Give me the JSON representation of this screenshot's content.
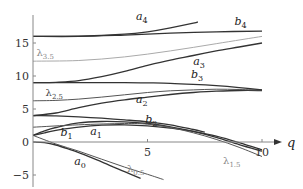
{
  "chart_data": {
    "type": "line",
    "title": "",
    "xlabel": "q",
    "ylabel": "",
    "xlim": [
      0,
      10.8
    ],
    "ylim": [
      -5.5,
      19
    ],
    "x_ticks": [
      5,
      10
    ],
    "x_tick_labels": [
      "5",
      "10"
    ],
    "y_ticks": [
      -5,
      0,
      5,
      10,
      15
    ],
    "y_tick_labels": [
      "−5",
      "0",
      "5",
      "10",
      "15"
    ],
    "grid": false,
    "legend": "none (inline curve labels)",
    "series": [
      {
        "name": "a0",
        "label": "a",
        "sub": "0",
        "color": "#333333",
        "points": [
          [
            0,
            0
          ],
          [
            0.5,
            -0.1
          ],
          [
            1,
            -0.45
          ],
          [
            1.5,
            -1.0
          ],
          [
            2,
            -1.6
          ],
          [
            2.5,
            -2.3
          ],
          [
            3,
            -3.0
          ],
          [
            3.5,
            -3.75
          ],
          [
            4,
            -4.5
          ],
          [
            4.7,
            -5.5
          ]
        ]
      },
      {
        "name": "λ0.5",
        "label": "λ",
        "sub": "0.5",
        "color": "#555555",
        "points": [
          [
            0,
            1
          ],
          [
            1,
            -0.3
          ],
          [
            2,
            -1.4
          ],
          [
            3,
            -2.6
          ],
          [
            4,
            -3.8
          ],
          [
            5,
            -4.9
          ],
          [
            5.7,
            -5.7
          ]
        ]
      },
      {
        "name": "b1",
        "label": "b",
        "sub": "1",
        "color": "#333333",
        "points": [
          [
            0,
            1
          ],
          [
            0.5,
            1.4
          ],
          [
            1,
            1.75
          ],
          [
            2,
            2.25
          ],
          [
            3,
            2.55
          ],
          [
            4,
            2.6
          ],
          [
            5,
            2.45
          ],
          [
            6,
            2.1
          ],
          [
            7,
            1.6
          ],
          [
            8,
            0.9
          ],
          [
            9,
            -0.1
          ],
          [
            10,
            -1.2
          ]
        ]
      },
      {
        "name": "a1",
        "label": "a",
        "sub": "1",
        "color": "#333333",
        "points": [
          [
            0,
            1
          ],
          [
            0.5,
            1.7
          ],
          [
            1,
            2.2
          ],
          [
            2,
            2.9
          ],
          [
            3,
            3.1
          ],
          [
            4,
            3.05
          ],
          [
            5,
            2.8
          ],
          [
            6,
            2.3
          ],
          [
            7,
            1.6
          ],
          [
            8,
            0.7
          ],
          [
            9,
            -0.4
          ],
          [
            10,
            -1.4
          ]
        ]
      },
      {
        "name": "λ1.5",
        "label": "λ",
        "sub": "1.5",
        "color": "#555555",
        "points": [
          [
            0,
            2.25
          ],
          [
            2,
            2.6
          ],
          [
            4,
            2.8
          ],
          [
            5,
            2.7
          ],
          [
            6,
            2.2
          ],
          [
            7,
            1.4
          ],
          [
            8,
            0.4
          ],
          [
            9,
            -0.8
          ],
          [
            10,
            -2.2
          ]
        ]
      },
      {
        "name": "b2",
        "label": "b",
        "sub": "2",
        "color": "#333333",
        "points": [
          [
            0,
            4
          ],
          [
            1,
            3.95
          ],
          [
            2,
            3.8
          ],
          [
            3,
            3.6
          ],
          [
            4,
            3.35
          ],
          [
            5,
            3.05
          ],
          [
            6,
            2.6
          ],
          [
            7,
            1.9
          ],
          [
            7.5,
            1.5
          ]
        ]
      },
      {
        "name": "a2",
        "label": "a",
        "sub": "2",
        "color": "#333333",
        "points": [
          [
            0,
            4
          ],
          [
            1,
            4.4
          ],
          [
            2,
            5.2
          ],
          [
            3,
            5.9
          ],
          [
            4,
            6.4
          ],
          [
            5,
            6.8
          ],
          [
            6,
            7.2
          ],
          [
            7,
            7.5
          ],
          [
            8,
            7.7
          ],
          [
            9,
            7.8
          ],
          [
            10,
            7.8
          ]
        ]
      },
      {
        "name": "λ2.5",
        "label": "λ",
        "sub": "2.5",
        "color": "#555555",
        "points": [
          [
            0,
            6.25
          ],
          [
            1,
            6.3
          ],
          [
            2,
            6.5
          ],
          [
            3,
            6.8
          ],
          [
            4,
            7.15
          ],
          [
            5,
            7.5
          ],
          [
            6,
            7.75
          ],
          [
            7,
            7.9
          ],
          [
            8,
            8.0
          ],
          [
            9,
            7.95
          ],
          [
            10,
            7.85
          ]
        ]
      },
      {
        "name": "b3",
        "label": "b",
        "sub": "3",
        "color": "#333333",
        "points": [
          [
            0,
            9
          ],
          [
            2,
            9.0
          ],
          [
            4,
            9.0
          ],
          [
            5,
            8.95
          ],
          [
            6,
            8.9
          ],
          [
            7,
            8.75
          ],
          [
            8,
            8.55
          ],
          [
            9,
            8.25
          ],
          [
            10,
            7.9
          ]
        ]
      },
      {
        "name": "a3",
        "label": "a",
        "sub": "3",
        "color": "#333333",
        "points": [
          [
            0,
            9
          ],
          [
            1,
            9.05
          ],
          [
            2,
            9.3
          ],
          [
            3,
            9.9
          ],
          [
            4,
            10.7
          ],
          [
            5,
            11.6
          ],
          [
            6,
            12.4
          ],
          [
            7,
            13.1
          ],
          [
            8,
            13.8
          ],
          [
            9,
            14.4
          ],
          [
            10,
            15.0
          ]
        ]
      },
      {
        "name": "λ3.5",
        "label": "λ",
        "sub": "3.5",
        "color": "#aaaaaa",
        "points": [
          [
            0,
            12.25
          ],
          [
            2,
            12.35
          ],
          [
            4,
            12.9
          ],
          [
            6,
            13.8
          ],
          [
            8,
            14.9
          ],
          [
            10,
            16.0
          ]
        ]
      },
      {
        "name": "b4",
        "label": "b",
        "sub": "4",
        "color": "#333333",
        "points": [
          [
            0,
            16
          ],
          [
            2,
            16.0
          ],
          [
            4,
            16.2
          ],
          [
            6,
            16.5
          ],
          [
            8,
            16.7
          ],
          [
            10,
            16.8
          ]
        ]
      },
      {
        "name": "a4",
        "label": "a",
        "sub": "4",
        "color": "#333333",
        "points": [
          [
            0,
            16
          ],
          [
            2,
            16.05
          ],
          [
            4,
            16.35
          ],
          [
            5,
            16.7
          ],
          [
            6,
            17.3
          ],
          [
            7,
            18.0
          ],
          [
            7.2,
            18.2
          ]
        ]
      }
    ],
    "annotations": [
      {
        "text": "a",
        "sub": "4",
        "x": 4.5,
        "y": 18.5,
        "style": "italic"
      },
      {
        "text": "b",
        "sub": "4",
        "x": 8.8,
        "y": 17.7,
        "style": "italic"
      },
      {
        "text": "λ",
        "sub": "3.5",
        "x": 0.15,
        "y": 13.0,
        "style": "gray"
      },
      {
        "text": "a",
        "sub": "3",
        "x": 7.0,
        "y": 11.7,
        "style": "italic"
      },
      {
        "text": "b",
        "sub": "3",
        "x": 6.9,
        "y": 9.7,
        "style": "italic"
      },
      {
        "text": "λ",
        "sub": "2.5",
        "x": 0.55,
        "y": 7.0,
        "style": "gray-dark"
      },
      {
        "text": "a",
        "sub": "2",
        "x": 4.5,
        "y": 5.9,
        "style": "italic"
      },
      {
        "text": "b",
        "sub": "2",
        "x": 4.9,
        "y": 2.9,
        "style": "italic"
      },
      {
        "text": "b",
        "sub": "1",
        "x": 1.2,
        "y": 0.9,
        "style": "italic"
      },
      {
        "text": "a",
        "sub": "1",
        "x": 2.5,
        "y": 1.1,
        "style": "italic"
      },
      {
        "text": "a",
        "sub": "0",
        "x": 1.8,
        "y": -3.5,
        "style": "italic"
      },
      {
        "text": "λ",
        "sub": "0.5",
        "x": 4.1,
        "y": -4.6,
        "style": "gray"
      },
      {
        "text": "λ",
        "sub": "1.5",
        "x": 8.3,
        "y": -3.4,
        "style": "gray"
      }
    ]
  },
  "axes": {
    "x_axis_label": "q",
    "y_tick_labels": [
      "15",
      "10",
      "5",
      "0",
      "−5"
    ],
    "x_tick_labels": [
      "5",
      "10"
    ]
  }
}
